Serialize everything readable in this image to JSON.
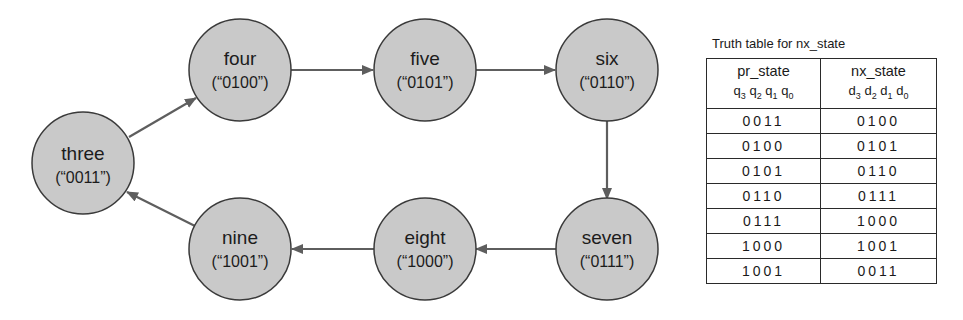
{
  "diagram": {
    "colors": {
      "node_fill": "#c9c9c9",
      "node_stroke": "#3a3a3a",
      "edge": "#5e5e5e"
    },
    "nodes": [
      {
        "id": "three",
        "label": "three",
        "code": "(“0011”)"
      },
      {
        "id": "four",
        "label": "four",
        "code": "(“0100”)"
      },
      {
        "id": "five",
        "label": "five",
        "code": "(“0101”)"
      },
      {
        "id": "six",
        "label": "six",
        "code": "(“0110”)"
      },
      {
        "id": "seven",
        "label": "seven",
        "code": "(“0111”)"
      },
      {
        "id": "eight",
        "label": "eight",
        "code": "(“1000”)"
      },
      {
        "id": "nine",
        "label": "nine",
        "code": "(“1001”)"
      }
    ],
    "edges": [
      {
        "from": "three",
        "to": "four"
      },
      {
        "from": "four",
        "to": "five"
      },
      {
        "from": "five",
        "to": "six"
      },
      {
        "from": "six",
        "to": "seven"
      },
      {
        "from": "seven",
        "to": "eight"
      },
      {
        "from": "eight",
        "to": "nine"
      },
      {
        "from": "nine",
        "to": "three"
      }
    ]
  },
  "truth_table": {
    "title": "Truth table for nx_state",
    "headers": [
      {
        "name": "pr_state",
        "bits": [
          "q",
          "3",
          "q",
          "2",
          "q",
          "1",
          "q",
          "0"
        ]
      },
      {
        "name": "nx_state",
        "bits": [
          "d",
          "3",
          "d",
          "2",
          "d",
          "1",
          "d",
          "0"
        ]
      }
    ],
    "rows": [
      {
        "pr": "0011",
        "nx": "0100"
      },
      {
        "pr": "0100",
        "nx": "0101"
      },
      {
        "pr": "0101",
        "nx": "0110"
      },
      {
        "pr": "0110",
        "nx": "0111"
      },
      {
        "pr": "0111",
        "nx": "1000"
      },
      {
        "pr": "1000",
        "nx": "1001"
      },
      {
        "pr": "1001",
        "nx": "0011"
      }
    ]
  }
}
